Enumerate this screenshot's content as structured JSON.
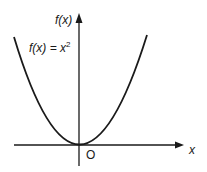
{
  "diagram": {
    "type": "function-graph",
    "function": "f(x) = x^2",
    "y_axis_label": "f(x)",
    "x_axis_label": "x",
    "origin_label": "O",
    "curve_label_lhs": "f(x) = x",
    "curve_label_exp": "2",
    "colors": {
      "line": "#1a1a1a",
      "background": "#ffffff"
    }
  }
}
